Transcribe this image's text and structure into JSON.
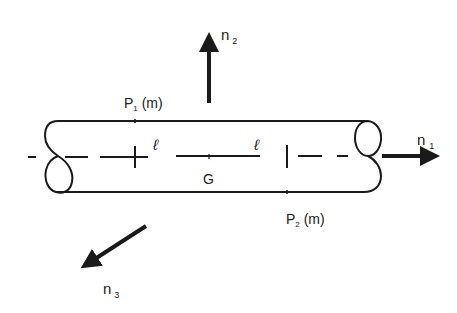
{
  "diagram": {
    "title": "",
    "colors": {
      "stroke": "#1a1a1a",
      "text": "#222222",
      "background": "#ffffff"
    },
    "labels": {
      "p1": {
        "main": "P",
        "sub": "1",
        "suffix": " (m)"
      },
      "p2": {
        "main": "P",
        "sub": "2",
        "suffix": " (m)"
      },
      "ell_left": "ℓ",
      "ell_right": "ℓ",
      "g": "G",
      "n1": {
        "main": "n",
        "sub": "1"
      },
      "n2": {
        "main": "n",
        "sub": "2"
      },
      "n3": {
        "main": "n",
        "sub": "3"
      }
    },
    "elements": [
      {
        "id": "cylinder",
        "type": "shape",
        "description": "horizontal cylinder with elliptical end caps"
      },
      {
        "id": "axis",
        "type": "dashed-line",
        "description": "central axis of cylinder"
      },
      {
        "id": "point-p1",
        "type": "marker",
        "description": "cross marking point P1 on axis"
      },
      {
        "id": "point-p2",
        "type": "marker",
        "description": "vertical tick marking point P2 on axis"
      },
      {
        "id": "segment-g",
        "type": "line",
        "description": "solid segment around centroid G"
      },
      {
        "id": "n1",
        "type": "arrow",
        "direction": "right"
      },
      {
        "id": "n2",
        "type": "arrow",
        "direction": "up"
      },
      {
        "id": "n3",
        "type": "arrow",
        "direction": "down-left"
      }
    ]
  }
}
